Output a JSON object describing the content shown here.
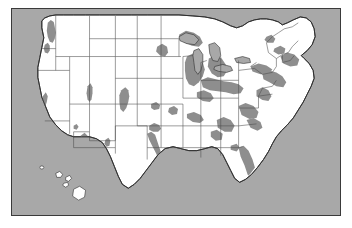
{
  "figure": {
    "name": "united-states-map",
    "type": "choropleth-map",
    "projection": "albers-usa",
    "frame": {
      "x": 11,
      "y": 8,
      "width": 330,
      "height": 208,
      "border_color": "#3a3a3a"
    }
  },
  "colors": {
    "ocean_background": "#a8a8a8",
    "land_fill": "#ffffff",
    "shaded_region_fill": "#8e8e8e",
    "state_border": "#4a4a4a",
    "coastline": "#2e2e2e",
    "frame_border": "#3a3a3a"
  },
  "legend": {
    "present": false,
    "shaded_meaning": "shaded metropolitan / high-density regions",
    "unshaded_meaning": "unshaded land area"
  },
  "insets": [
    {
      "name": "hawaii",
      "label": "",
      "shaded": false
    }
  ],
  "map_data": {
    "type": "map",
    "title": "",
    "regions_shaded": [
      {
        "name": "puget-sound-seattle",
        "state": "WA"
      },
      {
        "name": "portland-willamette",
        "state": "OR"
      },
      {
        "name": "california-coast-central-valley",
        "state": "CA"
      },
      {
        "name": "san-francisco-bay",
        "state": "CA"
      },
      {
        "name": "los-angeles-san-diego",
        "state": "CA"
      },
      {
        "name": "las-vegas",
        "state": "NV"
      },
      {
        "name": "salt-lake-city-wasatch",
        "state": "UT"
      },
      {
        "name": "denver-front-range",
        "state": "CO"
      },
      {
        "name": "phoenix-tucson",
        "state": "AZ"
      },
      {
        "name": "albuquerque",
        "state": "NM"
      },
      {
        "name": "dallas-fort-worth",
        "state": "TX"
      },
      {
        "name": "austin-san-antonio-houston",
        "state": "TX"
      },
      {
        "name": "gulf-coast-louisiana",
        "state": "LA"
      },
      {
        "name": "kansas-city",
        "state": "MO"
      },
      {
        "name": "st-louis",
        "state": "MO"
      },
      {
        "name": "minneapolis-st-paul",
        "state": "MN"
      },
      {
        "name": "chicago-milwaukee",
        "state": "IL"
      },
      {
        "name": "detroit-great-lakes",
        "state": "MI"
      },
      {
        "name": "ohio-indiana-rust-belt",
        "state": "OH"
      },
      {
        "name": "nashville-memphis",
        "state": "TN"
      },
      {
        "name": "atlanta-piedmont",
        "state": "GA"
      },
      {
        "name": "carolina-piedmont",
        "state": "NC"
      },
      {
        "name": "florida-coasts",
        "state": "FL"
      },
      {
        "name": "washington-baltimore",
        "state": "MD"
      },
      {
        "name": "philadelphia-new-york",
        "state": "NY"
      },
      {
        "name": "boston-southern-new-england",
        "state": "MA"
      }
    ],
    "states_outlined": 49,
    "grid": false
  }
}
